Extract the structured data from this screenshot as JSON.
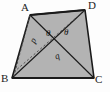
{
  "figure": {
    "type": "geometry-diagram",
    "shape": "quadrilateral",
    "fill_color": "#b3b3b3",
    "stroke_color": "#1a1a1a",
    "dashed_color": "#4a4a4a",
    "background_color": "#fdfdfd"
  },
  "vertices": [
    {
      "id": "A",
      "label": "A",
      "x": 30,
      "y": 15,
      "label_x": 21,
      "label_y": 3
    },
    {
      "id": "D",
      "label": "D",
      "x": 85,
      "y": 10,
      "label_x": 88,
      "label_y": 0
    },
    {
      "id": "C",
      "label": "C",
      "x": 94,
      "y": 78,
      "label_x": 95,
      "label_y": 75
    },
    {
      "id": "B",
      "label": "B",
      "x": 12,
      "y": 78,
      "label_x": 1,
      "label_y": 74
    }
  ],
  "edges": [
    {
      "id": "AD",
      "from": "A",
      "to": "D",
      "style": "solid"
    },
    {
      "id": "DC",
      "from": "D",
      "to": "C",
      "style": "solid"
    },
    {
      "id": "CB",
      "from": "C",
      "to": "B",
      "style": "solid"
    },
    {
      "id": "BA",
      "from": "B",
      "to": "A",
      "style": "solid"
    }
  ],
  "diagonals": [
    {
      "id": "AC",
      "from": "A",
      "to": "C",
      "style": "solid"
    },
    {
      "id": "BD",
      "from": "B",
      "to": "D",
      "style": "solid"
    }
  ],
  "dashed_segments": [
    {
      "id": "A-B-dashed",
      "from": "A",
      "to": "B",
      "style": "dashed"
    },
    {
      "id": "D-B-dashed",
      "from": "D",
      "to": "B",
      "style": "dashed"
    }
  ],
  "interior_labels": [
    {
      "id": "p",
      "text": "p",
      "x": 31,
      "y": 36,
      "rotated": true
    },
    {
      "id": "theta-left",
      "text": "θ",
      "x": 46,
      "y": 29,
      "rotated": false
    },
    {
      "id": "theta-right",
      "text": "θ",
      "x": 64,
      "y": 28,
      "rotated": false
    },
    {
      "id": "q",
      "text": "q",
      "x": 55,
      "y": 52,
      "rotated": true
    }
  ],
  "intersection_point": {
    "x": 57,
    "y": 38
  }
}
